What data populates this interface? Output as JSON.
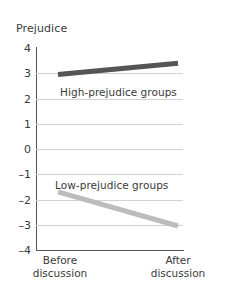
{
  "chart_data": {
    "type": "line",
    "title": "",
    "ylabel": "Prejudice",
    "xlabel": "",
    "categories": [
      "Before discussion",
      "After discussion"
    ],
    "x_tick_lines": [
      [
        "Before",
        "discussion"
      ],
      [
        "After",
        "discussion"
      ]
    ],
    "ylim": [
      -4,
      4
    ],
    "yticks": [
      4,
      3,
      2,
      1,
      0,
      -1,
      -2,
      -3,
      -4
    ],
    "ytick_labels": [
      "4",
      "3",
      "2",
      "1",
      "0",
      "–1",
      "–2",
      "–3",
      "–4"
    ],
    "grid": true,
    "grid_axis": "y",
    "legend": "in-plot annotations",
    "series": [
      {
        "name": "High-prejudice groups",
        "label": "High-prejudice groups",
        "color": "#555558",
        "values": [
          2.95,
          3.4
        ],
        "line_width": 5
      },
      {
        "name": "Low-prejudice groups",
        "label": "Low-prejudice groups",
        "color": "#bcbcbe",
        "values": [
          -1.7,
          -3.05
        ],
        "line_width": 5
      }
    ]
  },
  "colors": {
    "axis": "#55555a",
    "grid": "#d2d2d4",
    "text": "#3a3a3a",
    "high_series": "#555558",
    "low_series": "#bcbcbe",
    "background": "#ffffff"
  }
}
